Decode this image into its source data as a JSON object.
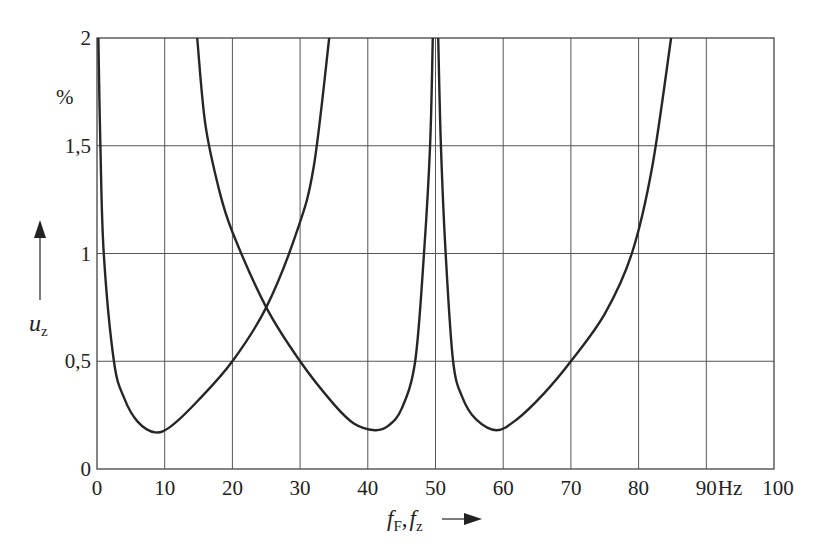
{
  "chart_data": {
    "type": "line",
    "title": "",
    "xlabel": {
      "main": "f",
      "sub1": "F",
      "sep": ",",
      "main2": "f",
      "sub2": "z"
    },
    "xunit": "Hz",
    "ylabel": {
      "main": "u",
      "sub": "z"
    },
    "yunit": "%",
    "xlim": [
      0,
      100
    ],
    "ylim": [
      0,
      2
    ],
    "grid": true,
    "x_ticks": [
      {
        "value": 0,
        "label": "0"
      },
      {
        "value": 10,
        "label": "10"
      },
      {
        "value": 20,
        "label": "20"
      },
      {
        "value": 30,
        "label": "30"
      },
      {
        "value": 40,
        "label": "40"
      },
      {
        "value": 50,
        "label": "50"
      },
      {
        "value": 60,
        "label": "60"
      },
      {
        "value": 70,
        "label": "70"
      },
      {
        "value": 80,
        "label": "80"
      },
      {
        "value": 90,
        "label": "90"
      },
      {
        "value": 100,
        "label": "100"
      }
    ],
    "y_ticks": [
      {
        "value": 0,
        "label": "0"
      },
      {
        "value": 0.5,
        "label": "0,5"
      },
      {
        "value": 1,
        "label": "1"
      },
      {
        "value": 1.5,
        "label": "1,5"
      },
      {
        "value": 2,
        "label": "2"
      }
    ],
    "series": [
      {
        "name": "curve-1",
        "x": [
          0.2,
          0.5,
          1,
          2.5,
          4,
          6,
          8.6,
          11,
          15,
          20,
          25,
          29.5,
          32,
          34.3
        ],
        "y": [
          2,
          1.5,
          1.0,
          0.5,
          0.33,
          0.22,
          0.17,
          0.2,
          0.32,
          0.5,
          0.75,
          1.1,
          1.4,
          2
        ]
      },
      {
        "name": "curve-2",
        "x": [
          14.8,
          16,
          18,
          20,
          25,
          30,
          35,
          38,
          41,
          43,
          45,
          47,
          48.3,
          49.2,
          49.6
        ],
        "y": [
          2,
          1.6,
          1.3,
          1.1,
          0.75,
          0.5,
          0.3,
          0.21,
          0.18,
          0.2,
          0.28,
          0.5,
          1.0,
          1.5,
          2
        ]
      },
      {
        "name": "curve-3",
        "x": [
          50.4,
          50.8,
          51.5,
          52.6,
          54,
          56,
          59,
          62,
          66,
          70,
          75,
          79,
          82,
          84.8
        ],
        "y": [
          2,
          1.5,
          1.0,
          0.5,
          0.33,
          0.23,
          0.18,
          0.23,
          0.35,
          0.5,
          0.72,
          1.0,
          1.4,
          2
        ]
      }
    ]
  }
}
